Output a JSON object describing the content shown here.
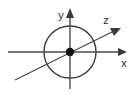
{
  "figure": {
    "name": "3d-coordinate-axes-with-circle",
    "background_color": "#ffffff",
    "stroke_color": "#4a4a4a",
    "circle_color": "#3d3d3d",
    "dot_color": "#111111",
    "label_color": "#2b2b2b",
    "width": 140,
    "height": 97
  },
  "labels": {
    "x_axis": "x",
    "y_axis": "y",
    "z_axis": "z"
  },
  "geometry": {
    "origin": {
      "x": 70,
      "y": 52
    },
    "circle_radius": 26,
    "x_axis": {
      "x1": 8,
      "y1": 52,
      "x2": 127,
      "y2": 52,
      "arrow": "right"
    },
    "y_axis": {
      "x1": 70,
      "y1": 88,
      "x2": 70,
      "y2": 9,
      "arrow": "up"
    },
    "z_axis": {
      "x1": 15,
      "y1": 80,
      "x2": 121,
      "y2": 28,
      "arrow": "upper-right"
    },
    "x_label_pos": {
      "x": 124,
      "y": 66
    },
    "y_label_pos": {
      "x": 60,
      "y": 18
    },
    "z_label_pos": {
      "x": 105,
      "y": 23
    }
  }
}
